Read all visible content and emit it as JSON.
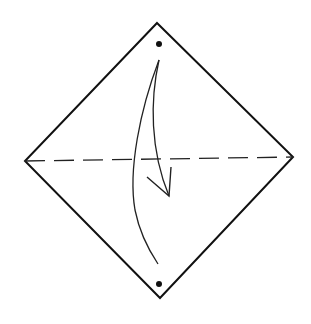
{
  "diagram": {
    "type": "origami-step",
    "colors": {
      "stroke": "#111111",
      "background": "#ffffff"
    },
    "square": {
      "top": [
        157,
        23
      ],
      "right": [
        293,
        157
      ],
      "bottom": [
        160,
        298
      ],
      "left": [
        25,
        161
      ]
    },
    "fold_line": {
      "style": "dashed",
      "from": [
        25,
        161
      ],
      "to": [
        293,
        157
      ]
    },
    "dots": [
      {
        "name": "top-dot",
        "x": 159,
        "y": 44
      },
      {
        "name": "bottom-dot",
        "x": 159,
        "y": 284
      }
    ],
    "arrow": {
      "from": "top-dot",
      "to": "bottom-dot",
      "direction": "down"
    }
  }
}
